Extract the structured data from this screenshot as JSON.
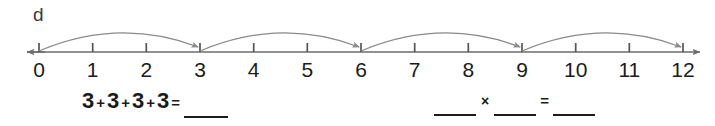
{
  "worksheet": {
    "part_letter": "d",
    "numberline": {
      "min": 0,
      "max": 12,
      "tick_labels": [
        "0",
        "1",
        "2",
        "3",
        "4",
        "5",
        "6",
        "7",
        "8",
        "9",
        "10",
        "11",
        "12"
      ],
      "axis_color": "#6d6d6d",
      "arc_color": "#8a8a8a",
      "jumps": [
        {
          "from": 0,
          "to": 3
        },
        {
          "from": 3,
          "to": 6
        },
        {
          "from": 6,
          "to": 9
        },
        {
          "from": 9,
          "to": 12
        }
      ],
      "jump_size": 3,
      "jump_count": 4,
      "left_arrow": true,
      "right_arrow": true
    },
    "equations": {
      "addition": {
        "terms": [
          "3",
          "3",
          "3",
          "3"
        ],
        "plus": "+",
        "equals": "=",
        "answer_blank": ""
      },
      "multiplication": {
        "factor1_blank": "",
        "times": "×",
        "factor2_blank": "",
        "equals": "=",
        "product_blank": ""
      }
    }
  }
}
